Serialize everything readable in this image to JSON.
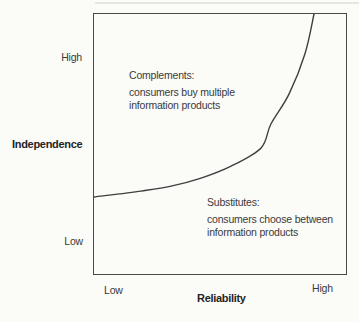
{
  "chart_data": {
    "type": "line",
    "title": "",
    "xlabel": "Reliability",
    "ylabel": "Independence",
    "x_ticks": [
      {
        "label": "Low",
        "position": "left"
      },
      {
        "label": "High",
        "position": "right"
      }
    ],
    "y_ticks": [
      {
        "label": "High",
        "position": "top"
      },
      {
        "label": "Low",
        "position": "bottom"
      }
    ],
    "axis_ranges": {
      "x": "qualitative Low to High",
      "y": "qualitative Low to High"
    },
    "grid": false,
    "legend": false,
    "series": [
      {
        "name": "complements-substitutes-boundary",
        "style": "solid exponential curve separating the two regions",
        "points": [
          [
            0.0,
            0.296
          ],
          [
            0.187,
            0.319
          ],
          [
            0.306,
            0.338
          ],
          [
            0.425,
            0.369
          ],
          [
            0.544,
            0.415
          ],
          [
            0.663,
            0.485
          ],
          [
            0.702,
            0.577
          ],
          [
            0.774,
            0.692
          ],
          [
            0.837,
            0.846
          ],
          [
            0.873,
            1.0
          ]
        ]
      }
    ],
    "annotations": [
      {
        "name": "complements",
        "region": "upper-left",
        "heading": "Complements:",
        "line1": "consumers buy multiple",
        "line2": "information products"
      },
      {
        "name": "substitutes",
        "region": "lower-right",
        "heading": "Substitutes:",
        "line1": "consumers choose between",
        "line2": "information products"
      }
    ],
    "colors": {
      "background": "#fbfbf8",
      "plot_border": "#4a4a4a",
      "curve": "#3f3f3f",
      "text": "#3a3a3a",
      "axis_title": "#242424"
    }
  }
}
